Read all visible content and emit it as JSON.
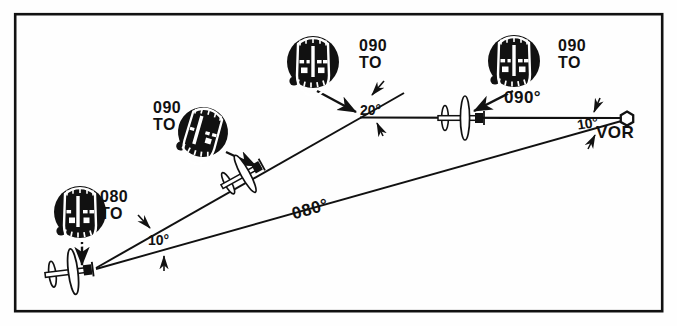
{
  "figure": {
    "kind": "vor-intercept-diagram",
    "background": "#fefefe",
    "ink": "#111111",
    "border": {
      "x": 14,
      "y": 13,
      "w": 650,
      "h": 300,
      "stroke_width": 2.5
    }
  },
  "station": {
    "name_label": "VOR",
    "x": 627,
    "y": 118,
    "label_x": 598,
    "label_y": 126,
    "marker": "hexagon-open"
  },
  "courses": {
    "radial_090_label": "090°",
    "radial_090_label_x": 506,
    "radial_090_label_y": 97,
    "radial_080_label": "080°",
    "radial_080_label_x": 298,
    "radial_080_label_y": 212,
    "radial_080_label_rotation": -16
  },
  "angles": [
    {
      "id": "angle-20",
      "text": "20°",
      "x": 370,
      "y": 101
    },
    {
      "id": "angle-10-vor",
      "text": "10°",
      "x": 581,
      "y": 118
    },
    {
      "id": "angle-10-aircraft",
      "text": "10°",
      "x": 152,
      "y": 234
    }
  ],
  "indications": [
    {
      "id": "ind-1",
      "course": "090",
      "flag": "TO",
      "x": 157,
      "y": 103
    },
    {
      "id": "ind-2",
      "course": "090",
      "flag": "TO",
      "x": 363,
      "y": 41
    },
    {
      "id": "ind-3",
      "course": "090",
      "flag": "TO",
      "x": 562,
      "y": 41
    },
    {
      "id": "ind-4",
      "course": "080",
      "flag": "TO",
      "x": 104,
      "y": 192
    }
  ],
  "instruments": [
    {
      "id": "cdi-1",
      "name": "vor-indicator-090-to-left",
      "cx": 203,
      "cy": 132,
      "r": 25,
      "rotation": 18,
      "needle_offset": -7,
      "knob_angle": 208
    },
    {
      "id": "cdi-2",
      "name": "vor-indicator-090-to-mid",
      "cx": 313,
      "cy": 62,
      "r": 26,
      "rotation": 0,
      "needle_offset": 0,
      "knob_angle": 212
    },
    {
      "id": "cdi-3",
      "name": "vor-indicator-090-to-right",
      "cx": 514,
      "cy": 61,
      "r": 26,
      "rotation": 0,
      "needle_offset": 0,
      "knob_angle": 212
    },
    {
      "id": "cdi-4",
      "name": "vor-indicator-080-to",
      "cx": 80,
      "cy": 212,
      "r": 26,
      "rotation": 0,
      "needle_offset": 0,
      "knob_angle": 212
    }
  ],
  "aircraft": [
    {
      "id": "ac-1",
      "name": "aircraft-on-090-radial",
      "x": 462,
      "y": 118,
      "heading": 0,
      "scale": 1.0
    },
    {
      "id": "ac-2",
      "name": "aircraft-on-intercept-mid",
      "x": 243,
      "y": 175,
      "heading": -28,
      "scale": 0.98
    },
    {
      "id": "ac-3",
      "name": "aircraft-at-origin",
      "x": 72,
      "y": 272,
      "heading": -6,
      "scale": 1.05
    }
  ],
  "pointers": [
    {
      "id": "ptr-1",
      "name": "pointer-to-aircraft-mid",
      "x1": 226,
      "y1": 152,
      "x2": 257,
      "y2": 167
    },
    {
      "id": "ptr-2",
      "name": "pointer-to-bend-point",
      "x1": 318,
      "y1": 92,
      "x2": 357,
      "y2": 114
    },
    {
      "id": "ptr-3",
      "name": "pointer-to-aircraft-right",
      "x1": 512,
      "y1": 92,
      "x2": 472,
      "y2": 112
    },
    {
      "id": "ptr-4",
      "name": "pointer-to-aircraft-left",
      "x1": 82,
      "y1": 243,
      "x2": 82,
      "y2": 266
    }
  ]
}
